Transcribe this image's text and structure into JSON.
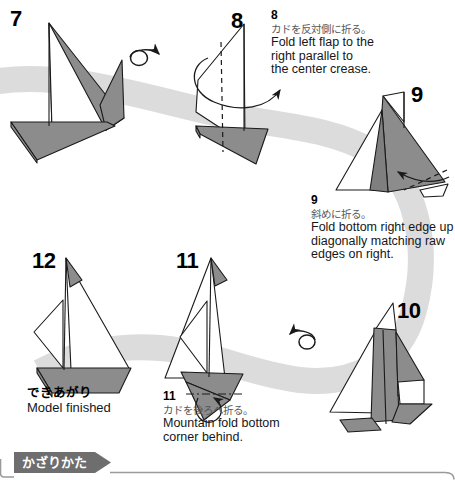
{
  "page": {
    "background_color": "#ffffff",
    "ribbon_color": "#dcdcdc",
    "paper_front_color": "#ffffff",
    "paper_back_color": "#8c8c8c",
    "line_color": "#1a1a1a"
  },
  "steps": [
    {
      "id": "step-7",
      "number": "7",
      "number_pos": {
        "x": 10,
        "y": 10
      },
      "jp": "",
      "en": ""
    },
    {
      "id": "step-8",
      "number": "8",
      "number_pos": {
        "x": 231,
        "y": 12
      },
      "caption_number": "8",
      "jp": "カドを反対側に折る。",
      "en": "Fold left flap to the right parallel to the center crease.",
      "en_lines": [
        "Fold left flap to the",
        "right parallel to",
        "the center crease."
      ],
      "caption_pos": {
        "x": 271,
        "y": 10
      }
    },
    {
      "id": "step-9",
      "number": "9",
      "number_pos": {
        "x": 411,
        "y": 86
      },
      "caption_number": "9",
      "jp": "斜めに折る。",
      "en": "Fold bottom right edge up diagonally matching raw edges on right.",
      "en_lines": [
        "Fold bottom right edge up",
        "diagonally matching raw",
        "edges on right."
      ],
      "caption_pos": {
        "x": 311,
        "y": 196
      }
    },
    {
      "id": "step-10",
      "number": "10",
      "number_pos": {
        "x": 398,
        "y": 302
      },
      "jp": "",
      "en": ""
    },
    {
      "id": "step-11",
      "number": "11",
      "number_pos": {
        "x": 176,
        "y": 252
      },
      "caption_number": "11",
      "jp": "カドを後ろへ折る。",
      "en": "Mountain fold bottom corner behind.",
      "en_lines": [
        "Mountain fold bottom",
        "corner behind."
      ],
      "caption_pos": {
        "x": 163,
        "y": 391
      }
    },
    {
      "id": "step-12",
      "number": "12",
      "number_pos": {
        "x": 32,
        "y": 252
      },
      "jp": "できあがり",
      "en": "Model finished",
      "caption_pos": {
        "x": 27,
        "y": 386
      }
    }
  ],
  "finish_label": {
    "jp": "できあがり",
    "en": "Model finished"
  },
  "bottom_banner": {
    "label": "かざりかた",
    "fill_color": "#6e6e6e",
    "text_color": "#ffffff",
    "border_color": "#8a8a8a"
  },
  "symbols": [
    {
      "name": "turn-over-arrow-7-8",
      "x": 130,
      "y": 52
    },
    {
      "name": "turn-over-arrow-10-11",
      "x": 300,
      "y": 332
    },
    {
      "name": "fold-arrow-step-8",
      "x": 205,
      "y": 60
    },
    {
      "name": "fold-arrow-step-9",
      "x": 390,
      "y": 172
    },
    {
      "name": "mountain-fold-arrow-step-11",
      "x": 208,
      "y": 382
    }
  ]
}
